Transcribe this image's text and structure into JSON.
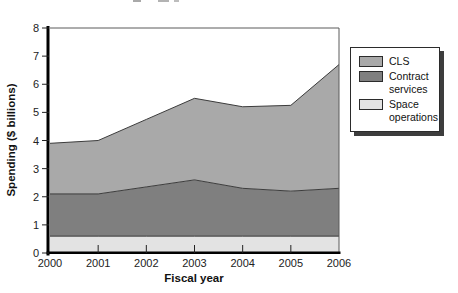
{
  "chart_data": {
    "type": "area",
    "stacked": true,
    "title": "",
    "xlabel": "Fiscal year",
    "ylabel": "Spending ($ billions)",
    "x": [
      2000,
      2001,
      2002,
      2003,
      2004,
      2005,
      2006
    ],
    "series": [
      {
        "name": "Space operations",
        "values": [
          0.6,
          0.6,
          0.6,
          0.6,
          0.6,
          0.6,
          0.6
        ],
        "color": "#e3e3e3"
      },
      {
        "name": "Contract services",
        "values": [
          1.5,
          1.5,
          1.75,
          2.0,
          1.7,
          1.6,
          1.7
        ],
        "color": "#7f7f7f"
      },
      {
        "name": "CLS",
        "values": [
          1.8,
          1.9,
          2.4,
          2.9,
          2.9,
          3.05,
          4.4
        ],
        "color": "#a9a9a9"
      }
    ],
    "stacked_totals": [
      3.9,
      4.0,
      4.75,
      5.5,
      5.2,
      5.25,
      6.7
    ],
    "ylim": [
      0,
      8
    ],
    "y_ticks": [
      0,
      1,
      2,
      3,
      4,
      5,
      6,
      7,
      8
    ],
    "x_ticks": [
      2000,
      2001,
      2002,
      2003,
      2004,
      2005,
      2006
    ],
    "grid": false,
    "legend_position": "right"
  },
  "axes": {
    "y_title": "Spending ($ billions)",
    "x_title": "Fiscal year"
  },
  "legend": {
    "items": [
      {
        "label": "CLS",
        "color": "#a9a9a9"
      },
      {
        "label": "Contract services",
        "color": "#7f7f7f"
      },
      {
        "label": "Space operations",
        "color": "#e3e3e3"
      }
    ]
  },
  "colors": {
    "background": "#ffffff",
    "axis": "#000000",
    "frame": "#5a5a5a",
    "boundary_line": "#3c3c3c",
    "tick": "#222222",
    "tick_label": "#222222",
    "legend_border": "#2b2b2b",
    "legend_shadow": "#3d3d3d"
  }
}
